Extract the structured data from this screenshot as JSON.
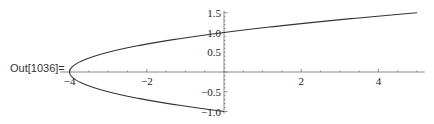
{
  "cell": {
    "output_label": "Out[1036]="
  },
  "chart_data": {
    "type": "line",
    "title": "",
    "xlabel": "",
    "ylabel": "",
    "series": [
      {
        "name": "upper branch",
        "x": [
          -4,
          -3,
          -2,
          -1,
          0,
          1,
          2,
          3,
          4,
          5
        ],
        "y": [
          0,
          0.5,
          0.707,
          0.866,
          1.0,
          1.118,
          1.225,
          1.323,
          1.414,
          1.5
        ]
      },
      {
        "name": "lower branch",
        "x": [
          -4,
          -3,
          -2,
          -1,
          0
        ],
        "y": [
          0,
          -0.5,
          -0.707,
          -0.866,
          -1.0
        ]
      }
    ],
    "xlim": [
      -4.2,
      5.2
    ],
    "ylim": [
      -1.05,
      1.55
    ],
    "x_ticks": [
      "-4",
      "-2",
      "2",
      "4"
    ],
    "y_ticks": [
      "1.5",
      "1.0",
      "0.5",
      "-0.5",
      "-1.0"
    ],
    "grid": false,
    "legend": null
  }
}
